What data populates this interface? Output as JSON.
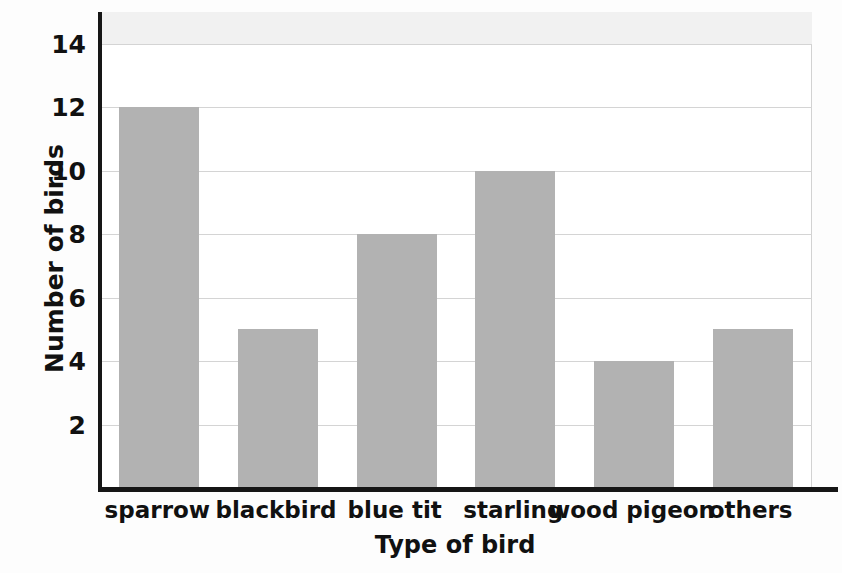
{
  "chart_data": {
    "type": "bar",
    "title": "",
    "categories": [
      "sparrow",
      "blackbird",
      "blue tit",
      "starling",
      "wood pigeon",
      "others"
    ],
    "values": [
      12,
      5,
      8,
      10,
      4,
      5
    ],
    "xlabel": "Type of bird",
    "ylabel": "Number of birds",
    "ylim": [
      0,
      14
    ],
    "ytick_labels": [
      "2",
      "4",
      "6",
      "8",
      "10",
      "12",
      "14"
    ],
    "ytick_values": [
      2,
      4,
      6,
      8,
      10,
      12,
      14
    ],
    "grid": "horizontal",
    "legend": "none",
    "bar_color": "#b2b2b2",
    "axis_color": "#161616",
    "grid_color": "#d4d4d4",
    "background_color": "#ffffff"
  }
}
